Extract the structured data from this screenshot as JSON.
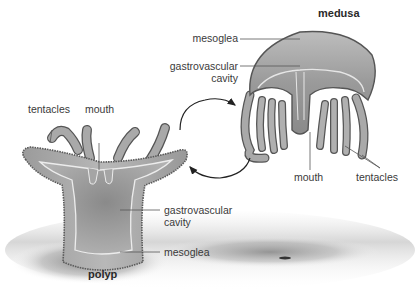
{
  "diagram": {
    "medusa": {
      "title": "medusa",
      "labels": {
        "mesoglea": "mesoglea",
        "gastrovascular_1": "gastrovascular",
        "gastrovascular_2": "cavity",
        "mouth": "mouth",
        "tentacles": "tentacles"
      }
    },
    "polyp": {
      "title": "polyp",
      "labels": {
        "tentacles": "tentacles",
        "mouth": "mouth",
        "gastrovascular_1": "gastrovascular",
        "gastrovascular_2": "cavity",
        "mesoglea": "mesoglea"
      }
    },
    "cycle_arrows": [
      "polyp-to-medusa",
      "medusa-to-polyp"
    ],
    "colors": {
      "body_fill": "#a8a8a8",
      "body_dark": "#7a7a7a",
      "body_outline": "#555555",
      "inner_line": "#e8e8e8",
      "ground_shadow": "#8c8c8c",
      "label_text": "#3a3a3a",
      "leader_line": "#555555"
    }
  }
}
